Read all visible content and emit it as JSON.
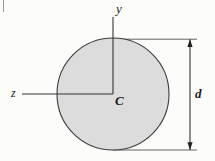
{
  "figure": {
    "type": "engineering-cross-section-diagram",
    "background_color": "#fcfcfb"
  },
  "shape": {
    "name": "circle",
    "fill_color": "#dcdcdc",
    "stroke_color": "#3a3a3a",
    "center_x": 113,
    "center_y": 94,
    "radius": 56
  },
  "axes": {
    "vertical": {
      "label": "y",
      "x": 113,
      "y_start": 17,
      "y_end": 94,
      "color": "#333333"
    },
    "horizontal": {
      "label": "z",
      "y": 94,
      "x_start": 22,
      "x_end": 113,
      "color": "#333333"
    }
  },
  "centroid": {
    "label": "C",
    "x": 113,
    "y": 94
  },
  "dimension": {
    "label": "d",
    "description": "diameter",
    "line_x": 190,
    "y_top": 39,
    "y_bottom": 150,
    "extension_top_y": 39,
    "extension_bottom_y": 150,
    "extension_x_end": 197,
    "color": "#333333"
  },
  "margin_mark": {
    "name": "page-margin-rule",
    "x": 3,
    "y_start": 0,
    "y_end": 12,
    "color": "#8a8a8a"
  }
}
